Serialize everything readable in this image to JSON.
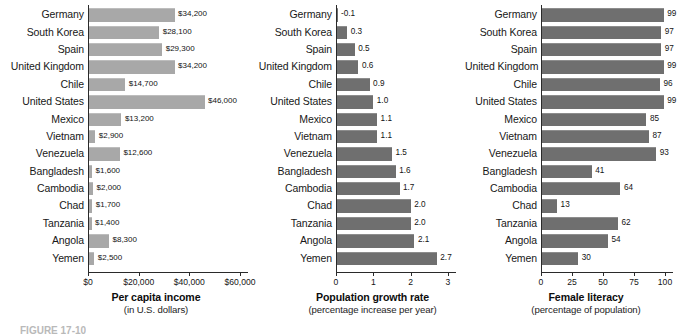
{
  "figure": {
    "caption": "FIGURE 17-10"
  },
  "chart_data": [
    {
      "type": "bar",
      "orientation": "horizontal",
      "title": "Per capita income",
      "subtitle": "(in U.S. dollars)",
      "xlabel": "Per capita income",
      "ylabel": "",
      "xlim": [
        0,
        60000
      ],
      "grid": false,
      "legend": "none",
      "tick_labels": [
        "$0",
        "$20,000",
        "$40,000",
        "$60,000"
      ],
      "tick_values": [
        0,
        20000,
        40000,
        60000
      ],
      "categories": [
        "Germany",
        "South Korea",
        "Spain",
        "United Kingdom",
        "Chile",
        "United States",
        "Mexico",
        "Vietnam",
        "Venezuela",
        "Bangladesh",
        "Cambodia",
        "Chad",
        "Tanzania",
        "Angola",
        "Yemen"
      ],
      "values": [
        34200,
        28100,
        29300,
        34200,
        14700,
        46000,
        13200,
        2900,
        12600,
        1600,
        2000,
        1700,
        1400,
        8300,
        2500
      ],
      "data_labels": [
        "$34,200",
        "$28,100",
        "$29,300",
        "$34,200",
        "$14,700",
        "$46,000",
        "$13,200",
        "$2,900",
        "$12,600",
        "$1,600",
        "$2,000",
        "$1,700",
        "$1,400",
        "$8,300",
        "$2,500"
      ]
    },
    {
      "type": "bar",
      "orientation": "horizontal",
      "title": "Population growth rate",
      "subtitle": "(percentage increase per year)",
      "xlabel": "Population growth rate",
      "ylabel": "",
      "xlim": [
        0,
        3
      ],
      "grid": false,
      "legend": "none",
      "tick_labels": [
        "0",
        "1",
        "2",
        "3"
      ],
      "tick_values": [
        0,
        1,
        2,
        3
      ],
      "categories": [
        "Germany",
        "South Korea",
        "Spain",
        "United Kingdom",
        "Chile",
        "United States",
        "Mexico",
        "Vietnam",
        "Venezuela",
        "Bangladesh",
        "Cambodia",
        "Chad",
        "Tanzania",
        "Angola",
        "Yemen"
      ],
      "values": [
        -0.1,
        0.3,
        0.5,
        0.6,
        0.9,
        1.0,
        1.1,
        1.1,
        1.5,
        1.6,
        1.7,
        2.0,
        2.0,
        2.1,
        2.7
      ],
      "data_labels": [
        "-0.1",
        "0.3",
        "0.5",
        "0.6",
        "0.9",
        "1.0",
        "1.1",
        "1.1",
        "1.5",
        "1.6",
        "1.7",
        "2.0",
        "2.0",
        "2.1",
        "2.7"
      ]
    },
    {
      "type": "bar",
      "orientation": "horizontal",
      "title": "Female literacy",
      "subtitle": "(percentage of population)",
      "xlabel": "Female literacy",
      "ylabel": "",
      "xlim": [
        0,
        100
      ],
      "grid": false,
      "legend": "none",
      "tick_labels": [
        "0",
        "25",
        "50",
        "75",
        "100"
      ],
      "tick_values": [
        0,
        25,
        50,
        75,
        100
      ],
      "categories": [
        "Germany",
        "South Korea",
        "Spain",
        "United Kingdom",
        "Chile",
        "United States",
        "Mexico",
        "Vietnam",
        "Venezuela",
        "Bangladesh",
        "Cambodia",
        "Chad",
        "Tanzania",
        "Angola",
        "Yemen"
      ],
      "values": [
        99,
        97,
        97,
        99,
        96,
        99,
        85,
        87,
        93,
        41,
        64,
        13,
        62,
        54,
        30
      ],
      "data_labels": [
        "99",
        "97",
        "97",
        "99",
        "96",
        "99",
        "85",
        "87",
        "93",
        "41",
        "64",
        "13",
        "62",
        "54",
        "30"
      ]
    }
  ],
  "colors": {
    "bar_light": "#a8a8a8",
    "bar_dark": "#6f6f6f",
    "axis": "#2a2a2a",
    "text": "#181818",
    "background": "#ffffff"
  }
}
